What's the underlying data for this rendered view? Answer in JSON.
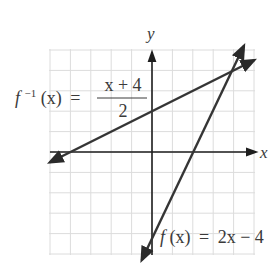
{
  "chart_data": {
    "type": "line",
    "title": "",
    "xlabel": "x",
    "ylabel": "y",
    "xlim": [
      -5,
      5
    ],
    "ylim": [
      -5,
      5
    ],
    "grid": true,
    "grid_step": 1,
    "legend": "none",
    "series": [
      {
        "name": "f(x) = 2x - 4",
        "label": {
          "fn": "f",
          "arg": "(x)",
          "eq": "=",
          "rhs": "2x − 4"
        },
        "slope": 2,
        "intercept": -4,
        "x": [
          -0.5,
          4.5
        ],
        "y": [
          -5,
          5
        ]
      },
      {
        "name": "f^-1(x) = (x + 4)/2",
        "label": {
          "fn": "f",
          "sup": "−1",
          "arg": "(x)",
          "eq": "=",
          "numerator": "x + 4",
          "denominator": "2"
        },
        "slope": 0.5,
        "intercept": 2,
        "x": [
          -5,
          5
        ],
        "y": [
          -0.5,
          4.5
        ]
      }
    ],
    "annotations": [
      {
        "text": "f(x) = 2x − 4",
        "near": [
          0,
          -4
        ]
      },
      {
        "text": "f⁻¹(x) = (x + 4)/2",
        "near": [
          -1,
          3
        ]
      }
    ],
    "intersection": [
      4,
      4
    ]
  },
  "axes": {
    "x_label": "x",
    "y_label": "y"
  },
  "colors": {
    "line": "#353535",
    "grid": "#dcdcdc",
    "axis": "#1e1e1e",
    "text": "#3a3a3a"
  }
}
